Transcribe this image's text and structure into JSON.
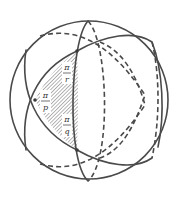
{
  "figure": {
    "stroke_color": "#4a4a4a",
    "hatch_color": "#6a6a6a",
    "background": "#ffffff",
    "triangle": {
      "angles": [
        {
          "vertex": "top",
          "numerator": "π",
          "denominator": "r"
        },
        {
          "vertex": "left",
          "numerator": "π",
          "denominator": "p"
        },
        {
          "vertex": "bottom",
          "numerator": "π",
          "denominator": "q"
        }
      ]
    },
    "great_circles": [
      {
        "name": "vertical-great-circle",
        "front": "solid",
        "back": "dashed"
      },
      {
        "name": "upper-tilted-great-circle",
        "front": "solid",
        "back": "dashed"
      },
      {
        "name": "lower-tilted-great-circle",
        "front": "solid",
        "back": "dashed"
      }
    ]
  }
}
